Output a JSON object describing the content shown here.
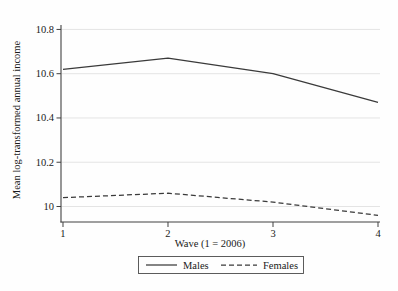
{
  "figure": {
    "background": "#fefefe"
  },
  "chart_data": {
    "type": "line",
    "title": "",
    "xlabel": "Wave (1 = 2006)",
    "ylabel": "Mean log-transformed annual income",
    "x": [
      1,
      2,
      3,
      4
    ],
    "xtick_values": [
      1,
      2,
      3,
      4
    ],
    "xtick_labels": [
      "1",
      "2",
      "3",
      "4"
    ],
    "ytick_values": [
      10,
      10.2,
      10.4,
      10.6,
      10.8
    ],
    "ytick_labels": [
      "10",
      "10.2",
      "10.4",
      "10.6",
      "10.8"
    ],
    "xlim": [
      0.981,
      4.019
    ],
    "ylim": [
      9.93,
      10.82
    ],
    "grid": "horizontal",
    "legend_position": "bottom-center",
    "series": [
      {
        "name": "Males",
        "style": "solid",
        "values": [
          10.62,
          10.67,
          10.6,
          10.47
        ]
      },
      {
        "name": "Females",
        "style": "dashed",
        "values": [
          10.04,
          10.06,
          10.02,
          9.96
        ]
      }
    ],
    "colors": {
      "line": "#3a3a3a",
      "grid": "#e4e4e4",
      "axis": "#404040",
      "text": "#1a1a1a",
      "legend_border": "#4a4a4a",
      "background": "#fefefe"
    }
  }
}
